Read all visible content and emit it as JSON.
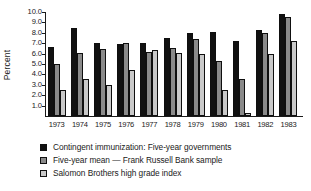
{
  "chart_data": {
    "type": "bar",
    "title": "",
    "xlabel": "",
    "ylabel": "Percent",
    "ylim": [
      0.0,
      10.0
    ],
    "yticks": [
      "10.0",
      "9.0",
      "8.0",
      "7.0",
      "6.0",
      "5.0",
      "4.0",
      "3.0",
      "2.0",
      "1.0"
    ],
    "ytick_values": [
      10.0,
      9.0,
      8.0,
      7.0,
      6.0,
      5.0,
      4.0,
      3.0,
      2.0,
      1.0
    ],
    "grid": false,
    "legend_position": "below",
    "categories": [
      "1973",
      "1974",
      "1975",
      "1976",
      "1977",
      "1978",
      "1979",
      "1980",
      "1981",
      "1982",
      "1983"
    ],
    "series": [
      {
        "name": "Contingent immunization: Five-year governments",
        "color": "#111111",
        "values": [
          6.6,
          8.5,
          7.05,
          6.95,
          7.0,
          7.5,
          7.95,
          8.1,
          7.25,
          8.25,
          9.8
        ]
      },
      {
        "name": "Five-year mean — Frank Russell Bank sample",
        "color": "#8a8a8a",
        "values": [
          5.0,
          6.1,
          6.45,
          7.0,
          6.15,
          6.5,
          7.45,
          5.25,
          3.6,
          8.0,
          9.55
        ]
      },
      {
        "name": "Salomon Brothers high grade index",
        "color": "#c9c9c9",
        "values": [
          2.5,
          3.6,
          3.0,
          4.4,
          6.35,
          6.1,
          6.0,
          2.5,
          0.0,
          6.0,
          7.25
        ]
      }
    ]
  },
  "legend": {
    "items": [
      {
        "label": "Contingent immunization: Five-year governments",
        "swatch": "legend-swatch-black"
      },
      {
        "label": "Five-year mean — Frank Russell Bank sample",
        "swatch": "legend-swatch-darkgray"
      },
      {
        "label": "Salomon Brothers high grade index",
        "swatch": "legend-swatch-lightgray"
      }
    ]
  }
}
